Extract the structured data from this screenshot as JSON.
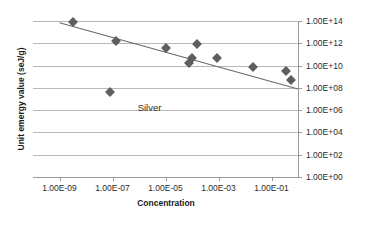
{
  "chart_data": {
    "type": "scatter",
    "title": "",
    "xlabel": "Concentration",
    "ylabel": "Unit emergy value (seJ/g)",
    "annotation": "Silver",
    "xscale": "log",
    "yscale": "log",
    "xlim": [
      1e-10,
      1.0
    ],
    "ylim": [
      1.0,
      100000000000000.0
    ],
    "grid": true,
    "legend_position": "none",
    "xtick_labels": [
      "1.00E-09",
      "1.00E-07",
      "1.00E-05",
      "1.00E-03",
      "1.00E-01"
    ],
    "xtick_values": [
      1e-09,
      1e-07,
      1e-05,
      0.001,
      0.1
    ],
    "ytick_labels": [
      "1.00E+14",
      "1.00E+12",
      "1.00E+10",
      "1.00E+08",
      "1.00E+06",
      "1.00E+04",
      "1.00E+02",
      "1.00E+00"
    ],
    "ytick_values": [
      100000000000000.0,
      1000000000000.0,
      10000000000.0,
      100000000.0,
      1000000.0,
      10000.0,
      100.0,
      1.0
    ],
    "series": [
      {
        "name": "Silver",
        "marker": "diamond",
        "color": "#5e5e5e",
        "points": [
          {
            "x": 3.2e-09,
            "y": 90000000000000.0
          },
          {
            "x": 1.3e-07,
            "y": 1600000000000.0
          },
          {
            "x": 1e-05,
            "y": 400000000000.0
          },
          {
            "x": 8e-05,
            "y": 16000000000.0
          },
          {
            "x": 0.0001,
            "y": 50000000000.0
          },
          {
            "x": 0.00015,
            "y": 950000000000.0
          },
          {
            "x": 0.0009,
            "y": 50000000000.0
          },
          {
            "x": 0.02,
            "y": 7000000000.0
          },
          {
            "x": 0.36,
            "y": 3000000000.0
          },
          {
            "x": 0.56,
            "y": 500000000.0
          },
          {
            "x": 8e-08,
            "y": 40000000.0
          }
        ]
      }
    ],
    "trendline": {
      "type": "linear-on-log-log",
      "color": "#6a6a6a",
      "start": {
        "x": 1e-09,
        "y": 70000000000000.0
      },
      "end": {
        "x": 1.0,
        "y": 80000000.0
      }
    }
  },
  "colors": {
    "marker": "#5e5e5e",
    "trendline": "#6a6a6a",
    "gridline": "#b8b8b8",
    "axis": "#9a9a9a",
    "text": "#2b2b2b",
    "title_text": "#1a1a1a",
    "background": "#ffffff"
  }
}
